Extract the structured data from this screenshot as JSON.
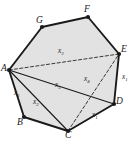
{
  "figure": {
    "shape": "heptagon",
    "fill_color": "#e2e2e2",
    "stroke_color": "#1a1a1a",
    "dashed_stroke_color": "#3a3a3a",
    "background_color": "#ffffff",
    "vertices": [
      {
        "id": "A",
        "label": "A",
        "x": 9,
        "y": 70,
        "label_x": 1,
        "label_y": 64
      },
      {
        "id": "B",
        "label": "B",
        "x": 24,
        "y": 117,
        "label_x": 17,
        "label_y": 118
      },
      {
        "id": "C",
        "label": "C",
        "x": 68,
        "y": 131,
        "label_x": 65,
        "label_y": 131
      },
      {
        "id": "D",
        "label": "D",
        "x": 114,
        "y": 104,
        "label_x": 116,
        "label_y": 97
      },
      {
        "id": "E",
        "label": "E",
        "x": 119,
        "y": 54,
        "label_x": 121,
        "label_y": 45
      },
      {
        "id": "F",
        "label": "F",
        "x": 88,
        "y": 17,
        "label_x": 84,
        "label_y": 5
      },
      {
        "id": "G",
        "label": "G",
        "x": 42,
        "y": 27,
        "label_x": 36,
        "label_y": 16
      }
    ],
    "outline_edges": [
      {
        "from": "A",
        "to": "B",
        "style": "solid"
      },
      {
        "from": "B",
        "to": "C",
        "style": "solid"
      },
      {
        "from": "C",
        "to": "D",
        "style": "solid"
      },
      {
        "from": "D",
        "to": "E",
        "style": "solid"
      },
      {
        "from": "E",
        "to": "F",
        "style": "solid"
      },
      {
        "from": "F",
        "to": "G",
        "style": "solid"
      },
      {
        "from": "G",
        "to": "A",
        "style": "solid"
      }
    ],
    "internal_segments": [
      {
        "from": "A",
        "to": "C",
        "style": "solid"
      },
      {
        "from": "A",
        "to": "D",
        "style": "solid"
      },
      {
        "from": "C",
        "to": "E",
        "style": "dashed"
      },
      {
        "from": "A",
        "to": "E",
        "style": "dashed"
      }
    ],
    "segment_labels": [
      {
        "name": "label-x1-ab",
        "text": "x",
        "sub": "1",
        "x": 14,
        "y": 90,
        "for": "A-B"
      },
      {
        "name": "label-x2-ac",
        "text": "x",
        "sub": "2",
        "x": 33,
        "y": 99,
        "for": "A-C"
      },
      {
        "name": "label-x3-ae",
        "text": "x",
        "sub": "3",
        "x": 58,
        "y": 48,
        "for": "A-E"
      },
      {
        "name": "label-x4-ce",
        "text": "x",
        "sub": "4",
        "x": 84,
        "y": 76,
        "for": "C-E"
      },
      {
        "name": "label-x5-ad",
        "text": "x",
        "sub": "5",
        "x": 55,
        "y": 82,
        "for": "A-D"
      },
      {
        "name": "label-x1-de",
        "text": "x",
        "sub": "1",
        "x": 122,
        "y": 74,
        "for": "D-E"
      },
      {
        "name": "label-x1-cd",
        "text": "x",
        "sub": "1",
        "x": 92,
        "y": 112,
        "for": "C-D"
      }
    ]
  }
}
